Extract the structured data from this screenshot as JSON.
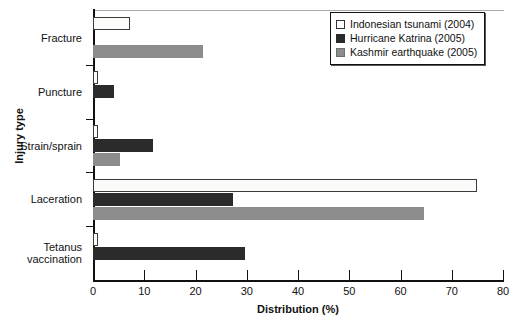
{
  "chart_data": {
    "type": "bar",
    "orientation": "horizontal",
    "title": "",
    "xlabel": "Distribution (%)",
    "ylabel": "Injury type",
    "categories": [
      "Fracture",
      "Puncture",
      "Strain/sprain",
      "Laceration",
      "Tetanus vaccination"
    ],
    "xlim": [
      0,
      80
    ],
    "xticks": [
      0,
      10,
      20,
      30,
      40,
      50,
      60,
      70,
      80
    ],
    "xticklabels": [
      "0",
      "10",
      "20",
      "30",
      "40",
      "50",
      "60",
      "70",
      "80"
    ],
    "grid": false,
    "legend_position": "top-right",
    "series": [
      {
        "name": "Indonesian tsunami (2004)",
        "color": "#ffffff",
        "values": [
          7.2,
          1.0,
          1.0,
          75.0,
          1.0
        ]
      },
      {
        "name": "Hurricane Katrina (2005)",
        "color": "#2b2b2b",
        "values": [
          0,
          4.0,
          11.7,
          27.3,
          29.7
        ]
      },
      {
        "name": "Kashmir earthquake (2005)",
        "color": "#8c8c8c",
        "values": [
          21.5,
          0,
          5.3,
          64.6,
          0
        ]
      }
    ]
  },
  "categories_display": [
    [
      "Fracture"
    ],
    [
      "Puncture"
    ],
    [
      "Strain/sprain"
    ],
    [
      "Laceration"
    ],
    [
      "Tetanus",
      "vaccination"
    ]
  ]
}
